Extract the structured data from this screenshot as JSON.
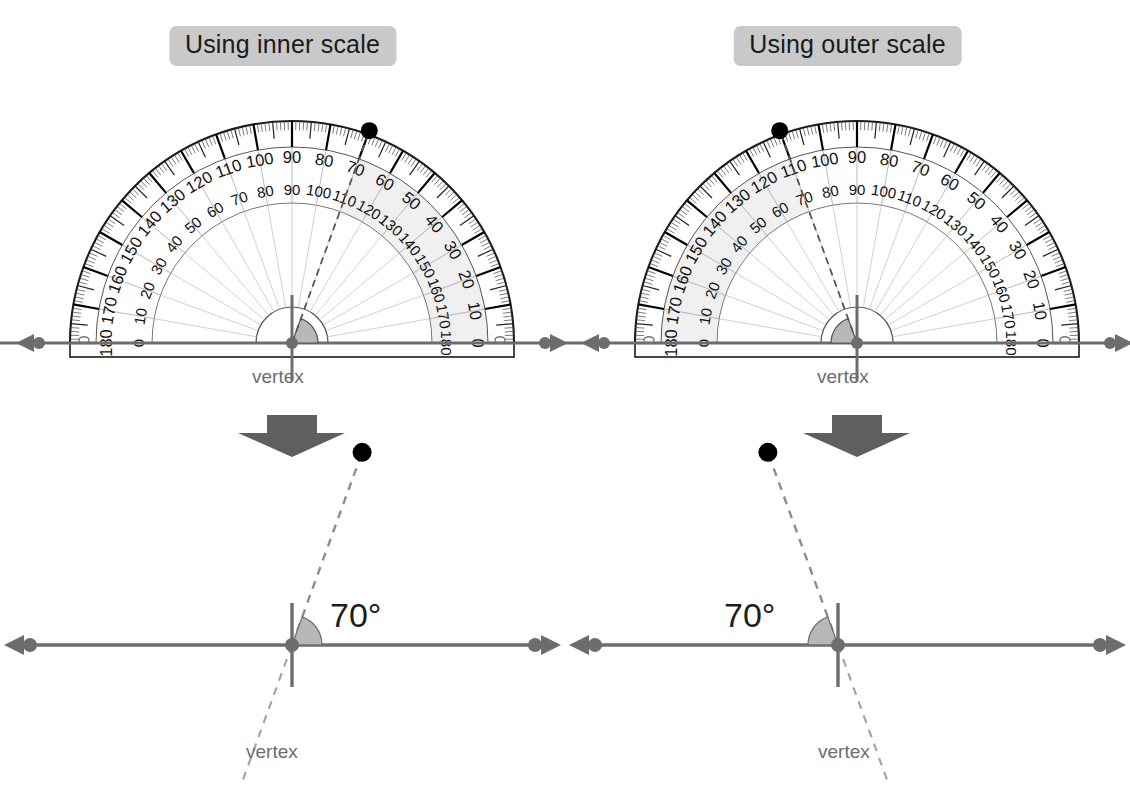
{
  "page": {
    "background_color": "#ffffff"
  },
  "panels": [
    {
      "id": "inner",
      "heading": "Using inner scale",
      "heading_bg": "#c9c9c9",
      "protractor": {
        "outer_scale_zero_side": "right",
        "inner_scale_zero_side": "left",
        "major_labels": [
          0,
          10,
          20,
          30,
          40,
          50,
          60,
          70,
          80,
          90,
          100,
          110,
          120,
          130,
          140,
          150,
          160,
          170,
          180
        ],
        "shaded_from_deg": 0,
        "shaded_to_deg": 70,
        "shaded_scale": "inner",
        "reading_deg": 70,
        "marker_dot_deg": 70,
        "dashed_ray_deg": 70,
        "vertex_label": "vertex"
      },
      "result": {
        "angle_label": "70°",
        "vertex_label": "vertex",
        "ray_direction": "right-opening",
        "dashed_ray_deg": 70
      }
    },
    {
      "id": "outer",
      "heading": "Using outer scale",
      "heading_bg": "#c9c9c9",
      "protractor": {
        "outer_scale_zero_side": "right",
        "inner_scale_zero_side": "left",
        "major_labels": [
          0,
          10,
          20,
          30,
          40,
          50,
          60,
          70,
          80,
          90,
          100,
          110,
          120,
          130,
          140,
          150,
          160,
          170,
          180
        ],
        "shaded_from_deg": 110,
        "shaded_to_deg": 180,
        "shaded_scale": "outer",
        "reading_deg": 70,
        "marker_dot_deg": 110,
        "dashed_ray_deg": 110,
        "vertex_label": "vertex"
      },
      "result": {
        "angle_label": "70°",
        "vertex_label": "vertex",
        "ray_direction": "left-opening",
        "dashed_ray_deg": 110
      }
    }
  ],
  "colors": {
    "ray": "#6d6d6d",
    "dashed": "#8a8a8a",
    "angle_fill": "#b8b8b8",
    "arrow": "#5f5f5f",
    "scale_band": "#f2f2f2",
    "tick": "#111111",
    "text": "#1a1a1a",
    "label_gray": "#6d6d6d",
    "vertex_mark": "#6d6d6d",
    "dot": "#000000"
  },
  "arrow_icon": "down-arrow"
}
